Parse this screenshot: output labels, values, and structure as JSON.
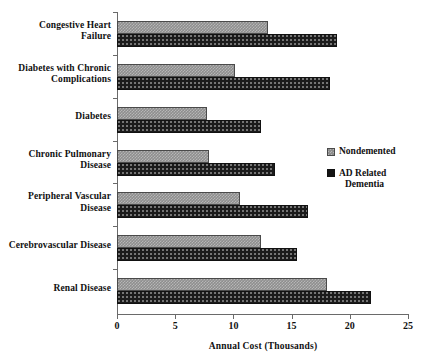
{
  "chart_data": {
    "type": "bar",
    "orientation": "horizontal",
    "title": "",
    "xlabel": "Annual Cost (Thousands)",
    "ylabel": "",
    "xlim": [
      0,
      25
    ],
    "xticks": [
      0,
      5,
      10,
      15,
      20,
      25
    ],
    "xtick_labels": [
      "0",
      "5",
      "10",
      "15",
      "20",
      "25"
    ],
    "grid": false,
    "legend_position": "right",
    "categories": [
      "Congestive Heart\nFailure",
      "Diabetes with Chronic\nComplications",
      "Diabetes",
      "Chronic Pulmonary\nDisease",
      "Peripheral Vascular\nDisease",
      "Cerebrovascular Disease",
      "Renal Disease"
    ],
    "series": [
      {
        "name": "Nondemented",
        "color": "#8e8e8e",
        "pattern": "checker",
        "values": [
          13.0,
          10.1,
          7.7,
          7.9,
          10.6,
          12.4,
          18.0
        ]
      },
      {
        "name": "AD Related Dementia",
        "color": "#1b1b1b",
        "pattern": "dotted",
        "values": [
          18.9,
          18.3,
          12.4,
          13.6,
          16.4,
          15.5,
          21.8
        ]
      }
    ]
  },
  "legend": {
    "items": [
      {
        "label": "Nondemented",
        "label_line2": ""
      },
      {
        "label": "AD Related",
        "label_line2": "Dementia"
      }
    ]
  }
}
